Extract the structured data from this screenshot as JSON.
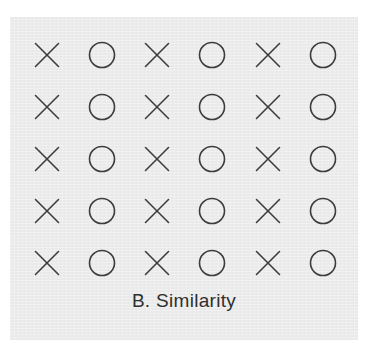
{
  "figure": {
    "caption": "B. Similarity",
    "panel_background_color": "#ededed",
    "page_background_color": "#ffffff",
    "stroke_color": "#3d3d3d",
    "caption_color": "#2f2f2f"
  },
  "chart_data": {
    "type": "scatter",
    "title": "B. Similarity",
    "subtitle": "",
    "xlabel": "",
    "ylabel": "",
    "grid": false,
    "legend_position": "none",
    "columns": 6,
    "rows": 5,
    "column_centers_x": [
      47,
      102,
      157,
      212,
      268,
      323
    ],
    "row_centers_y": [
      55,
      107,
      159,
      211,
      263
    ],
    "column_symbols": [
      "X",
      "O",
      "X",
      "O",
      "X",
      "O"
    ],
    "symbol_size_px": 26,
    "cells": [
      [
        "X",
        "O",
        "X",
        "O",
        "X",
        "O"
      ],
      [
        "X",
        "O",
        "X",
        "O",
        "X",
        "O"
      ],
      [
        "X",
        "O",
        "X",
        "O",
        "X",
        "O"
      ],
      [
        "X",
        "O",
        "X",
        "O",
        "X",
        "O"
      ],
      [
        "X",
        "O",
        "X",
        "O",
        "X",
        "O"
      ]
    ]
  }
}
